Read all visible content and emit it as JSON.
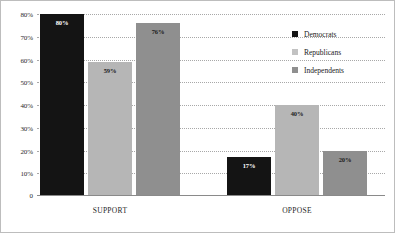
{
  "chart_data": {
    "type": "bar",
    "title": "",
    "xlabel": "",
    "ylabel": "",
    "ylim": [
      0,
      80
    ],
    "grid": true,
    "legend_position": "right",
    "categories": [
      "SUPPORT",
      "OPPOSE"
    ],
    "series": [
      {
        "name": "Democrats",
        "color": "#141414",
        "values": [
          80,
          17
        ],
        "labels": [
          "80%",
          "17%"
        ]
      },
      {
        "name": "Republicans",
        "color": "#b6b6b6",
        "values": [
          59,
          40
        ],
        "labels": [
          "59%",
          "40%"
        ]
      },
      {
        "name": "Independents",
        "color": "#8f8f8f",
        "values": [
          76,
          20
        ],
        "labels": [
          "76%",
          "20%"
        ]
      }
    ],
    "y_ticks": [
      {
        "value": 80,
        "label": "80%"
      },
      {
        "value": 70,
        "label": "70%"
      },
      {
        "value": 60,
        "label": "60%"
      },
      {
        "value": 50,
        "label": "50%"
      },
      {
        "value": 40,
        "label": "40%"
      },
      {
        "value": 30,
        "label": "30%"
      },
      {
        "value": 20,
        "label": "20%"
      },
      {
        "value": 10,
        "label": "10%"
      }
    ],
    "zero_label": "0"
  }
}
